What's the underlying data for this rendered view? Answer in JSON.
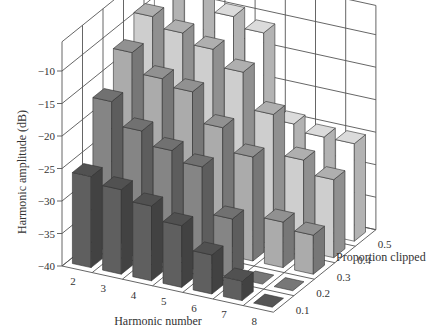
{
  "chart_data": {
    "type": "bar3d",
    "title": "",
    "xlabel": "Harmonic number",
    "ylabel": "Proportion clipped",
    "zlabel": "Harmonic amplitude (dB)",
    "x_categories": [
      "2",
      "3",
      "4",
      "5",
      "6",
      "7",
      "8"
    ],
    "y_categories": [
      "0.1",
      "0.2",
      "0.3",
      "0.4",
      "0.5"
    ],
    "z_ticks": [
      "-10",
      "-15",
      "-20",
      "-25",
      "-30",
      "-35",
      "-40"
    ],
    "zlim": [
      -40,
      -10
    ],
    "series": [
      {
        "name": "0.1",
        "color": "#555555",
        "values": [
          -26,
          -27,
          -28.5,
          -30.5,
          -34,
          -37,
          -40
        ]
      },
      {
        "name": "0.2",
        "color": "#777777",
        "values": [
          -17,
          -20.5,
          -22.5,
          -24,
          -31,
          -40,
          -40
        ]
      },
      {
        "name": "0.3",
        "color": "#999999",
        "values": [
          -12,
          -15,
          -16,
          -20.5,
          -24,
          -33,
          -34
        ]
      },
      {
        "name": "0.4",
        "color": "#b8b8b8",
        "values": [
          -9,
          -10.5,
          -12,
          -14.5,
          -20,
          -26,
          -28
        ]
      },
      {
        "name": "0.5",
        "color": "#e6e6e6",
        "values": [
          -3,
          -6,
          -9.5,
          -11,
          -24,
          -25,
          -25
        ]
      }
    ],
    "grid": true,
    "legend": "none"
  }
}
